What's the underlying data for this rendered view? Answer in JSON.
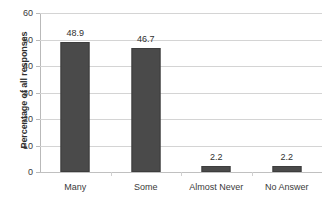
{
  "chart_data": {
    "type": "bar",
    "title": "",
    "subtitle": "",
    "xlabel": "",
    "ylabel": "Percentage of all responses",
    "categories": [
      "Many",
      "Some",
      "Almost Never",
      "No Answer"
    ],
    "values": [
      48.9,
      46.7,
      2.2,
      2.2
    ],
    "value_labels": [
      "48.9",
      "46.7",
      "2.2",
      "2.2"
    ],
    "ylim": [
      0,
      60
    ],
    "ytick_step": 10,
    "ytick_labels": [
      "0",
      "10",
      "20",
      "30",
      "40",
      "50",
      "60"
    ],
    "ytick_values": [
      0,
      10,
      20,
      30,
      40,
      50,
      60
    ],
    "grid": "horizontal",
    "legend": "none",
    "series": [
      {
        "name": "Percentage of all responses",
        "values": [
          48.9,
          46.7,
          2.2,
          2.2
        ]
      }
    ],
    "colors": {
      "bar_fill": "#4a4a4a",
      "bar_border": "#3d3d3d",
      "gridline": "#d4d4d4",
      "axis": "#b9b9b9",
      "text": "#3a3a3a",
      "background": "#ffffff"
    }
  }
}
